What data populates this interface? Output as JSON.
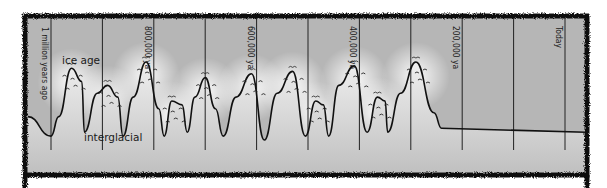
{
  "diagram": {
    "region_labels": {
      "ice_age": "ice age",
      "interglacial": "interglacial"
    },
    "time_markers": [
      {
        "label": "1 million years ago",
        "time_kya": 1000
      },
      {
        "label": "800,000 ya",
        "time_kya": 800
      },
      {
        "label": "600,000 ya",
        "time_kya": 600
      },
      {
        "label": "400,000 ya",
        "time_kya": 400
      },
      {
        "label": "200,000 ya",
        "time_kya": 200
      },
      {
        "label": "Today",
        "time_kya": 0
      }
    ],
    "gridline_interval_kya": 100,
    "ice_profile": {
      "description": "relative ice volume (0 = interglacial low, 1 = max glaciation)",
      "points_kya_level": [
        [
          1045,
          0.3
        ],
        [
          1000,
          0.05
        ],
        [
          985,
          0.3
        ],
        [
          960,
          0.92
        ],
        [
          940,
          0.75
        ],
        [
          935,
          0.1
        ],
        [
          910,
          0.6
        ],
        [
          890,
          0.7
        ],
        [
          870,
          0.55
        ],
        [
          860,
          0.05
        ],
        [
          840,
          0.55
        ],
        [
          815,
          1.0
        ],
        [
          790,
          0.4
        ],
        [
          780,
          0.05
        ],
        [
          765,
          0.5
        ],
        [
          745,
          0.45
        ],
        [
          735,
          0.1
        ],
        [
          720,
          0.55
        ],
        [
          700,
          0.8
        ],
        [
          680,
          0.4
        ],
        [
          665,
          0.05
        ],
        [
          640,
          0.55
        ],
        [
          610,
          0.85
        ],
        [
          585,
          0.0
        ],
        [
          560,
          0.6
        ],
        [
          530,
          0.88
        ],
        [
          505,
          0.05
        ],
        [
          485,
          0.5
        ],
        [
          470,
          0.45
        ],
        [
          460,
          0.05
        ],
        [
          440,
          0.7
        ],
        [
          410,
          0.95
        ],
        [
          385,
          0.1
        ],
        [
          365,
          0.55
        ],
        [
          350,
          0.5
        ],
        [
          345,
          0.1
        ],
        [
          320,
          0.6
        ],
        [
          290,
          1.0
        ],
        [
          255,
          0.35
        ],
        [
          240,
          0.15
        ]
      ]
    },
    "colors": {
      "frame": "#111111",
      "sky": "#b4b4b4",
      "ice": "#f4f4f4",
      "ground": "#c8c8c8",
      "outline": "#111111"
    }
  }
}
